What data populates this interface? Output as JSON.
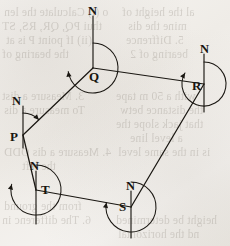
{
  "figure": {
    "kind": "closed-traverse-bearing-diagram",
    "width": 230,
    "height": 246,
    "ink_color": "#1a1712",
    "paper_color": "#f3f1ed"
  },
  "chart_data": {
    "type": "scatter",
    "title": "",
    "xlabel": "",
    "ylabel": "",
    "xlim": [
      0,
      230
    ],
    "ylim": [
      0,
      246
    ],
    "grid": false,
    "legend": null,
    "stations": [
      {
        "label": "P",
        "x": 23,
        "y": 135,
        "label_x": 10,
        "label_y": 130
      },
      {
        "label": "Q",
        "x": 93,
        "y": 68,
        "label_x": 89,
        "label_y": 70
      },
      {
        "label": "R",
        "x": 204,
        "y": 84,
        "label_x": 192,
        "label_y": 79
      },
      {
        "label": "S",
        "x": 131,
        "y": 207,
        "label_x": 119,
        "label_y": 200
      },
      {
        "label": "T",
        "x": 36,
        "y": 190,
        "label_x": 41,
        "label_y": 183
      }
    ],
    "traverse_legs": [
      {
        "from": "P",
        "to": "Q"
      },
      {
        "from": "Q",
        "to": "R"
      },
      {
        "from": "R",
        "to": "S"
      },
      {
        "from": "S",
        "to": "T"
      },
      {
        "from": "T",
        "to": "P"
      }
    ],
    "meridians": [
      {
        "at": "P",
        "label": "N",
        "label_x": 12,
        "label_y": 95,
        "top_y": 106,
        "bottom_y": 148
      },
      {
        "at": "Q",
        "label": "N",
        "label_x": 88,
        "label_y": 5,
        "top_y": 16,
        "bottom_y": 68
      },
      {
        "at": "R",
        "label": "N",
        "label_x": 200,
        "label_y": 43,
        "top_y": 54,
        "bottom_y": 112
      },
      {
        "at": "S",
        "label": "N",
        "label_x": 126,
        "label_y": 180,
        "top_y": 191,
        "bottom_y": 238
      },
      {
        "at": "T",
        "label": "N",
        "label_x": 30,
        "label_y": 160,
        "top_y": 171,
        "bottom_y": 224
      }
    ],
    "bearing_arcs": [
      {
        "at": "P",
        "from_deg": 0,
        "to_deg": 46,
        "radius": 22,
        "direction": "clockwise",
        "arrow": true
      },
      {
        "at": "Q",
        "from_deg": 0,
        "to_deg": 262,
        "radius": 25,
        "direction": "clockwise",
        "arrow": true
      },
      {
        "at": "R",
        "from_deg": 0,
        "to_deg": 300,
        "radius": 22,
        "direction": "clockwise",
        "arrow": true
      },
      {
        "at": "S",
        "from_deg": 0,
        "to_deg": 280,
        "radius": 25,
        "direction": "clockwise",
        "arrow": true
      },
      {
        "at": "T",
        "from_deg": 0,
        "to_deg": 283,
        "radius": 25,
        "direction": "clockwise",
        "arrow": true
      }
    ]
  },
  "labels": {
    "station_P": "P",
    "station_Q": "Q",
    "station_R": "R",
    "station_S": "S",
    "station_T": "T",
    "north_P": "N",
    "north_Q": "N",
    "north_R": "N",
    "north_S": "N",
    "north_T": "N"
  },
  "showthrough_text": [
    {
      "text": "o (i) Calculate the len",
      "x": 4,
      "y": 6
    },
    {
      "text": "thui PQ, QR, RS, ST",
      "x": 2,
      "y": 20
    },
    {
      "text": "(ii) If point P is at",
      "x": 6,
      "y": 34
    },
    {
      "text": "the bearing of",
      "x": 2,
      "y": 48
    },
    {
      "text": "al the height of",
      "x": 122,
      "y": 6
    },
    {
      "text": "mine the dis",
      "x": 128,
      "y": 20
    },
    {
      "text": "5. Diffrence",
      "x": 126,
      "y": 34
    },
    {
      "text": "bearing of 2",
      "x": 130,
      "y": 48
    },
    {
      "text": "3. Measure a dist",
      "x": 2,
      "y": 90
    },
    {
      "text": "To measure a dis",
      "x": 4,
      "y": 104
    },
    {
      "text": "with a 50 m tape",
      "x": 116,
      "y": 90
    },
    {
      "text": "the distance betw",
      "x": 120,
      "y": 104
    },
    {
      "text": "that jack slope the",
      "x": 116,
      "y": 118
    },
    {
      "text": "a level line",
      "x": 130,
      "y": 132
    },
    {
      "text": "4. Measure a dis ODD",
      "x": 4,
      "y": 146
    },
    {
      "text": "the left",
      "x": 22,
      "y": 160
    },
    {
      "text": "is in the same level",
      "x": 118,
      "y": 146
    },
    {
      "text": "from the ground",
      "x": 4,
      "y": 200
    },
    {
      "text": "6. The differenc in",
      "x": 2,
      "y": 214
    },
    {
      "text": "height be determined",
      "x": 116,
      "y": 214
    },
    {
      "text": "nd the horizontal",
      "x": 118,
      "y": 228
    }
  ]
}
